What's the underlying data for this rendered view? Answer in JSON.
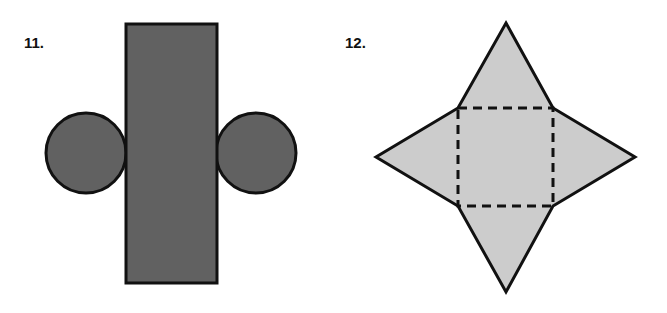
{
  "figures": [
    {
      "number": "11.",
      "description": "net of a cylinder: rectangle with two circles",
      "fill": "#616161",
      "stroke": "#111111"
    },
    {
      "number": "12.",
      "description": "net of a square pyramid: square with four triangles",
      "fill": "#cccccc",
      "stroke": "#111111"
    }
  ]
}
